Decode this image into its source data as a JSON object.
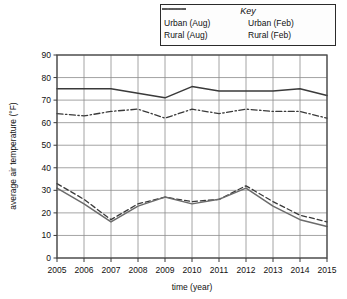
{
  "legend": {
    "title": "Key",
    "items": [
      {
        "label": "Urban (Aug)",
        "style": "solid",
        "color": "#3a3a3a"
      },
      {
        "label": "Urban (Feb)",
        "style": "dashed",
        "color": "#3a3a3a"
      },
      {
        "label": "Rural (Aug)",
        "style": "dashdot",
        "color": "#3a3a3a"
      },
      {
        "label": "Rural (Feb)",
        "style": "solid",
        "color": "#6b6b6b"
      }
    ]
  },
  "chart_data": {
    "type": "line",
    "title": "",
    "xlabel": "time (year)",
    "ylabel": "average air temperature (°F)",
    "x": [
      2005,
      2006,
      2007,
      2008,
      2009,
      2010,
      2011,
      2012,
      2013,
      2014,
      2015
    ],
    "categories": [
      "2005",
      "2006",
      "2007",
      "2008",
      "2009",
      "2010",
      "2011",
      "2012",
      "2013",
      "2014",
      "2015"
    ],
    "xlim": [
      2005,
      2015
    ],
    "ylim": [
      0,
      90
    ],
    "yticks": [
      0,
      10,
      20,
      30,
      40,
      50,
      60,
      70,
      80,
      90
    ],
    "grid": true,
    "legend_position": "top-right",
    "series": [
      {
        "name": "Urban (Aug)",
        "style": "solid",
        "color": "#3a3a3a",
        "values": [
          75,
          75,
          75,
          73,
          71,
          76,
          74,
          74,
          74,
          75,
          72
        ]
      },
      {
        "name": "Rural (Aug)",
        "style": "dashdot",
        "color": "#3a3a3a",
        "values": [
          64,
          63,
          65,
          66,
          62,
          66,
          64,
          66,
          65,
          65,
          62
        ]
      },
      {
        "name": "Urban (Feb)",
        "style": "dashed",
        "color": "#3a3a3a",
        "values": [
          33,
          26,
          17,
          24,
          27,
          25,
          26,
          32,
          25,
          19,
          16
        ]
      },
      {
        "name": "Rural (Feb)",
        "style": "solid",
        "color": "#6b6b6b",
        "values": [
          31,
          24,
          16,
          23,
          27,
          24,
          26,
          31,
          23,
          17,
          14
        ]
      }
    ]
  }
}
